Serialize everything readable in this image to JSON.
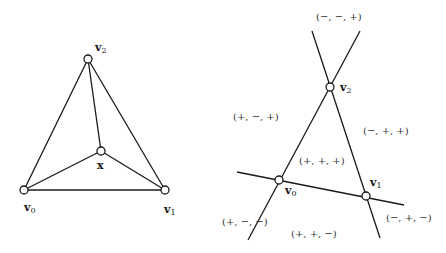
{
  "left_diagram": {
    "labels": {
      "v0": {
        "base": "v",
        "sub": "0"
      },
      "v1": {
        "base": "v",
        "sub": "1"
      },
      "v2": {
        "base": "v",
        "sub": "2"
      },
      "x": "x"
    }
  },
  "right_diagram": {
    "labels": {
      "v0": {
        "base": "v",
        "sub": "0"
      },
      "v1": {
        "base": "v",
        "sub": "1"
      },
      "v2": {
        "base": "v",
        "sub": "2"
      }
    },
    "regions": {
      "top": "(−, −, +)",
      "upper_left": "(+, −, +)",
      "upper_right": "(−, +, +)",
      "center": "(+, +, +)",
      "lower_left": "(+, −, −)",
      "bottom": "(+, +, −)",
      "lower_right": "(−, +, −)"
    }
  }
}
